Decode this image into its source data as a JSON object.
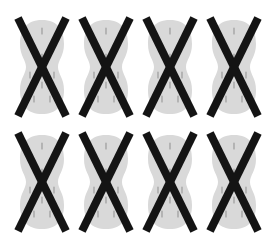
{
  "image": {
    "description": "Grid of 8 crossed-out peanut-shaped items",
    "rows": 2,
    "columns": 4,
    "colors": {
      "background": "#ffffff",
      "shape_fill": "#d9d9d9",
      "shape_marks": "#9a9a9a",
      "cross": "#141414"
    },
    "items": [
      {
        "row": 0,
        "col": 0,
        "label": "crossed-out-peanut"
      },
      {
        "row": 0,
        "col": 1,
        "label": "crossed-out-peanut"
      },
      {
        "row": 0,
        "col": 2,
        "label": "crossed-out-peanut"
      },
      {
        "row": 0,
        "col": 3,
        "label": "crossed-out-peanut"
      },
      {
        "row": 1,
        "col": 0,
        "label": "crossed-out-peanut"
      },
      {
        "row": 1,
        "col": 1,
        "label": "crossed-out-peanut"
      },
      {
        "row": 1,
        "col": 2,
        "label": "crossed-out-peanut"
      },
      {
        "row": 1,
        "col": 3,
        "label": "crossed-out-peanut"
      }
    ]
  }
}
